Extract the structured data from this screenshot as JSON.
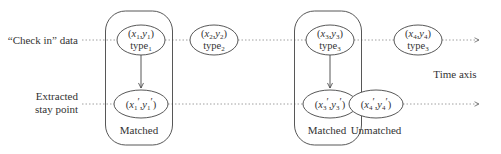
{
  "colors": {
    "stroke": "#444444",
    "dotted": "#888888",
    "text": "#333333",
    "background": "#ffffff"
  },
  "row_labels": {
    "checkin": "“Check in” data",
    "stay_line1": "Extracted",
    "stay_line2": "stay point"
  },
  "axis_label": "Time axis",
  "checkin_nodes": [
    {
      "x": "x",
      "xsub": "1",
      "y": "y",
      "ysub": "1",
      "type": "type",
      "typesub": "1"
    },
    {
      "x": "x",
      "xsub": "2",
      "y": "y",
      "ysub": "2",
      "type": "type",
      "typesub": "2"
    },
    {
      "x": "x",
      "xsub": "3",
      "y": "y",
      "ysub": "3",
      "type": "type",
      "typesub": "3"
    },
    {
      "x": "x",
      "xsub": "4",
      "y": "y",
      "ysub": "4",
      "type": "type",
      "typesub": "3"
    }
  ],
  "stay_nodes": [
    {
      "x": "x",
      "xsub": "1",
      "y": "y",
      "ysub": "1",
      "prime": "′"
    },
    {
      "x": "x",
      "xsub": "3",
      "y": "y",
      "ysub": "3",
      "prime": "′"
    },
    {
      "x": "x",
      "xsub": "4",
      "y": "y",
      "ysub": "4",
      "prime": "′"
    }
  ],
  "group_labels": {
    "matched_1": "Matched",
    "matched_2": "Matched",
    "unmatched": "Unmatched"
  },
  "punct": {
    "open": "(",
    "comma": ",",
    "close": ")"
  }
}
